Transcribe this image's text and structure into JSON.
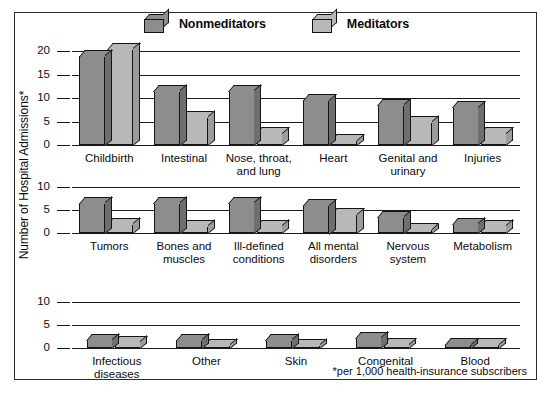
{
  "figure": {
    "ylabel": "Number of Hospital Admissions*",
    "footnote": "*per 1,000 health-insurance subscribers"
  },
  "legend": {
    "position": "top-center",
    "entries": [
      {
        "label": "Nonmeditators",
        "icon": "bar-swatch-3d-icon",
        "color": "#8d8d8d"
      },
      {
        "label": "Meditators",
        "icon": "bar-swatch-3d-icon",
        "color": "#b8b8b8"
      }
    ]
  },
  "colors": {
    "nonmeditators": "#8d8d8d",
    "meditators": "#b8b8b8",
    "outline": "#141414",
    "frame": "#2b2b2b",
    "background": "#ffffff"
  },
  "chart_data": {
    "type": "bar",
    "title": "",
    "subtitle": "",
    "xlabel": "",
    "ylabel": "Number of Hospital Admissions*",
    "annotations": [
      "*per 1,000 health-insurance subscribers"
    ],
    "grid": true,
    "legend": [
      "Nonmeditators",
      "Meditators"
    ],
    "panels": [
      {
        "panel_index": 0,
        "ylim": [
          0,
          20
        ],
        "yticks": [
          0,
          5,
          10,
          15,
          20
        ],
        "ytick_labels": [
          "0",
          "5",
          "10",
          "15",
          "20"
        ],
        "categories": [
          "Childbirth",
          "Intestinal",
          "Nose, throat,\nand lung",
          "Heart",
          "Genital and\nurinary",
          "Injuries"
        ],
        "series": [
          {
            "name": "Nonmeditators",
            "values": [
              19.0,
              11.5,
              11.5,
              9.5,
              8.5,
              8.0
            ]
          },
          {
            "name": "Meditators",
            "values": [
              20.5,
              6.0,
              2.5,
              1.0,
              5.0,
              2.5
            ]
          }
        ]
      },
      {
        "panel_index": 1,
        "ylim": [
          0,
          10
        ],
        "yticks": [
          0,
          5,
          10
        ],
        "ytick_labels": [
          "0",
          "5",
          "10"
        ],
        "categories": [
          "Tumors",
          "Bones and\nmuscles",
          "Ill-defined\nconditions",
          "All mental\ndisorders",
          "Nervous\nsystem",
          "Metabolism"
        ],
        "series": [
          {
            "name": "Nonmeditators",
            "values": [
              6.5,
              6.5,
              6.5,
              6.0,
              3.5,
              2.0
            ]
          },
          {
            "name": "Meditators",
            "values": [
              2.0,
              1.5,
              1.5,
              4.0,
              0.8,
              1.5
            ]
          }
        ]
      },
      {
        "panel_index": 2,
        "ylim": [
          0,
          10
        ],
        "yticks": [
          0,
          5,
          10
        ],
        "ytick_labels": [
          "0",
          "5",
          "10"
        ],
        "categories": [
          "Infectious\ndiseases",
          "Other",
          "Skin",
          "Congenital",
          "Blood"
        ],
        "series": [
          {
            "name": "Nonmeditators",
            "values": [
              1.8,
              1.8,
              1.8,
              2.2,
              0.8
            ]
          },
          {
            "name": "Meditators",
            "values": [
              1.3,
              0.6,
              0.5,
              0.8,
              0.8
            ]
          }
        ]
      }
    ]
  }
}
